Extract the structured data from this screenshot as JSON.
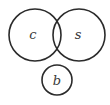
{
  "diagram": {
    "type": "venn",
    "stroke_color": "#2b2b2b",
    "text_color": "#3a3a3a",
    "background": "#ffffff",
    "sets": [
      {
        "id": "c",
        "label": "c",
        "cx": 35,
        "cy": 35,
        "r": 26,
        "label_x": 33,
        "label_y": 39
      },
      {
        "id": "s",
        "label": "s",
        "cx": 79,
        "cy": 35,
        "r": 26,
        "label_x": 78,
        "label_y": 39
      },
      {
        "id": "b",
        "label": "b",
        "cx": 57,
        "cy": 80,
        "r": 15,
        "label_x": 57,
        "label_y": 85
      }
    ],
    "relations": {
      "overlapping": [
        [
          "c",
          "s"
        ]
      ],
      "disjoint": [
        [
          "b",
          "c"
        ],
        [
          "b",
          "s"
        ]
      ]
    }
  }
}
